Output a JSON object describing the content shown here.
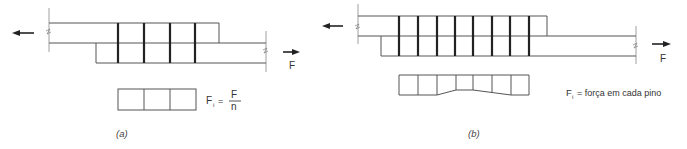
{
  "figure_a": {
    "caption": "(a)",
    "force_label": "F",
    "pin_count": 4,
    "load_distribution_cells": 3,
    "formula": {
      "lhs": "F",
      "lhs_subscript": "i",
      "equals": "=",
      "numerator": "F",
      "denominator": "n"
    }
  },
  "figure_b": {
    "caption": "(b)",
    "force_label": "F",
    "pin_count": 8,
    "load_distribution_cells": 7,
    "legend": {
      "symbol": "F",
      "symbol_subscript": "i",
      "text": "= força em cada pino"
    }
  },
  "colors": {
    "line": "#555555",
    "pin": "#222222",
    "text": "#333333"
  }
}
